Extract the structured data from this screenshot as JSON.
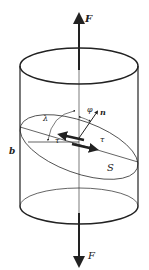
{
  "diagram": {
    "type": "schmid-law-cylinder",
    "labels": {
      "force_top": "F",
      "force_bottom": "F",
      "normal": "n",
      "phi": "φ",
      "lambda": "λ",
      "tau_left": "τ",
      "tau_right": "τ",
      "slip_direction": "b",
      "slip_plane": "S"
    },
    "colors": {
      "stroke": "#222222",
      "background": "#ffffff"
    }
  }
}
